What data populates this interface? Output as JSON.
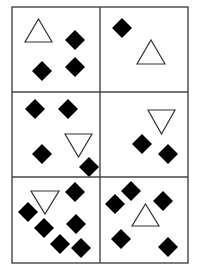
{
  "canvas": {
    "width": 199,
    "height": 276,
    "background": "#ffffff"
  },
  "grid": {
    "rows": 3,
    "cols": 2,
    "frame": {
      "x": 12,
      "y": 7,
      "width": 176,
      "height": 256
    },
    "col_dividers_x": [
      100
    ],
    "row_dividers_y": [
      92,
      177
    ],
    "line_color": "#444444",
    "line_width": 1.4
  },
  "style": {
    "diamond_fill": "#000000",
    "diamond_half_diagonal": 10,
    "triangle_stroke": "#333333",
    "triangle_fill": "#ffffff",
    "triangle_stroke_width": 1.2
  },
  "panels": [
    {
      "id": "panel-1",
      "row": 0,
      "col": 0,
      "triangle": {
        "orientation": "up",
        "x1": 25,
        "x2": 52,
        "y1": 19,
        "y2": 42
      },
      "diamonds": [
        [
          75,
          40
        ],
        [
          42,
          71
        ],
        [
          75,
          67
        ]
      ]
    },
    {
      "id": "panel-2",
      "row": 0,
      "col": 1,
      "triangle": {
        "orientation": "up",
        "x1": 137,
        "x2": 165,
        "y1": 40,
        "y2": 64
      },
      "diamonds": [
        [
          122,
          28
        ]
      ]
    },
    {
      "id": "panel-3",
      "row": 1,
      "col": 0,
      "triangle": {
        "orientation": "down",
        "x1": 65,
        "x2": 92,
        "y1": 134,
        "y2": 157
      },
      "diamonds": [
        [
          35,
          109
        ],
        [
          68,
          109
        ],
        [
          42,
          154
        ],
        [
          89,
          167
        ]
      ]
    },
    {
      "id": "panel-4",
      "row": 1,
      "col": 1,
      "triangle": {
        "orientation": "down",
        "x1": 148,
        "x2": 175,
        "y1": 110,
        "y2": 134
      },
      "diamonds": [
        [
          142,
          144
        ],
        [
          168,
          154
        ]
      ]
    },
    {
      "id": "panel-5",
      "row": 2,
      "col": 0,
      "triangle": {
        "orientation": "down",
        "x1": 31,
        "x2": 59,
        "y1": 191,
        "y2": 214
      },
      "diamonds": [
        [
          75,
          192
        ],
        [
          28,
          212
        ],
        [
          44,
          228
        ],
        [
          76,
          224
        ],
        [
          60,
          244
        ],
        [
          81,
          248
        ]
      ]
    },
    {
      "id": "panel-6",
      "row": 2,
      "col": 1,
      "triangle": {
        "orientation": "up",
        "x1": 132,
        "x2": 159,
        "y1": 204,
        "y2": 226
      },
      "diamonds": [
        [
          131,
          191
        ],
        [
          115,
          204
        ],
        [
          163,
          201
        ],
        [
          121,
          239
        ],
        [
          168,
          247
        ]
      ]
    }
  ]
}
